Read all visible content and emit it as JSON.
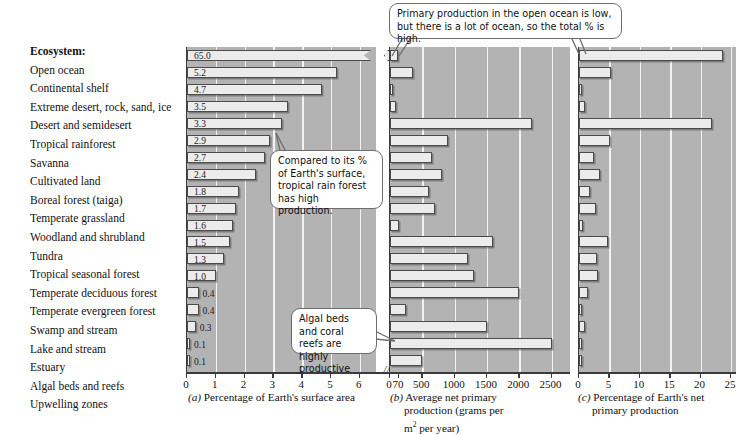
{
  "figure": {
    "ecosystem_header": "Ecosystem:",
    "ecosystems": [
      "Open ocean",
      "Continental shelf",
      "Extreme desert, rock, sand, ice",
      "Desert and semidesert",
      "Tropical rainforest",
      "Savanna",
      "Cultivated land",
      "Boreal forest (taiga)",
      "Temperate grassland",
      "Woodland and shrubland",
      "Tundra",
      "Tropical seasonal forest",
      "Temperate deciduous forest",
      "Temperate evergreen forest",
      "Swamp and stream",
      "Lake and stream",
      "Estuary",
      "Algal beds and reefs",
      "Upwelling zones"
    ],
    "callouts": [
      {
        "id": "open-ocean-callout",
        "text": "Primary production in the open ocean is low, but there is a lot of ocean, so the total % is high."
      },
      {
        "id": "rainforest-callout",
        "text": "Compared to its % of Earth's surface, tropical rain forest has high production."
      },
      {
        "id": "algal-callout",
        "text": "Algal beds and coral reefs are highly productive"
      }
    ]
  },
  "chart_data": [
    {
      "id": "panel-a",
      "type": "bar",
      "orientation": "horizontal",
      "panel_letter": "(a)",
      "title": "Percentage of Earth's surface area",
      "xlabel": "Percentage of Earth's surface area",
      "ylabel": "Ecosystem",
      "xlim": [
        0,
        6.6
      ],
      "axis_break": true,
      "break_note": "axis broken between 6 and 70",
      "xticks": [
        0,
        1,
        2,
        3,
        4,
        5,
        6,
        70
      ],
      "xticklabels": [
        "0",
        "1",
        "2",
        "3",
        "4",
        "5",
        "6",
        "70"
      ],
      "grid": true,
      "legend": false,
      "categories": [
        "Open ocean",
        "Continental shelf",
        "Extreme desert, rock, sand, ice",
        "Desert and semidesert",
        "Tropical rainforest",
        "Savanna",
        "Cultivated land",
        "Boreal forest (taiga)",
        "Temperate grassland",
        "Woodland and shrubland",
        "Tundra",
        "Tropical seasonal forest",
        "Temperate deciduous forest",
        "Temperate evergreen forest",
        "Swamp and stream",
        "Lake and stream",
        "Estuary",
        "Algal beds and reefs",
        "Upwelling zones"
      ],
      "values": [
        65.0,
        5.2,
        4.7,
        3.5,
        3.3,
        2.9,
        2.7,
        2.4,
        1.8,
        1.7,
        1.6,
        1.5,
        1.3,
        1.0,
        0.4,
        0.4,
        0.3,
        0.1,
        0.1
      ],
      "datalabels": [
        "65.0",
        "5.2",
        "4.7",
        "3.5",
        "3.3",
        "2.9",
        "2.7",
        "2.4",
        "1.8",
        "1.7",
        "1.6",
        "1.5",
        "1.3",
        "1.0",
        "0.4",
        "0.4",
        "0.3",
        "0.1",
        "0.1"
      ]
    },
    {
      "id": "panel-b",
      "type": "bar",
      "orientation": "horizontal",
      "panel_letter": "(b)",
      "title": "Average net primary production (grams per m2 per year)",
      "xlabel": "Average net primary production (grams per m² per year)",
      "ylabel": "Ecosystem",
      "xlim": [
        0,
        2800
      ],
      "xticks": [
        0,
        500,
        1000,
        1500,
        2000,
        2500
      ],
      "xticklabels": [
        "0",
        "500",
        "1000",
        "1500",
        "2000",
        "2500"
      ],
      "grid": true,
      "legend": false,
      "categories": [
        "Open ocean",
        "Continental shelf",
        "Extreme desert, rock, sand, ice",
        "Desert and semidesert",
        "Tropical rainforest",
        "Savanna",
        "Cultivated land",
        "Boreal forest (taiga)",
        "Temperate grassland",
        "Woodland and shrubland",
        "Tundra",
        "Tropical seasonal forest",
        "Temperate deciduous forest",
        "Temperate evergreen forest",
        "Swamp and stream",
        "Lake and stream",
        "Estuary",
        "Algal beds and reefs",
        "Upwelling zones"
      ],
      "values": [
        125,
        360,
        3,
        90,
        2200,
        900,
        650,
        800,
        600,
        700,
        140,
        1600,
        1200,
        1300,
        2000,
        250,
        1500,
        2500,
        500
      ]
    },
    {
      "id": "panel-c",
      "type": "bar",
      "orientation": "horizontal",
      "panel_letter": "(c)",
      "title": "Percentage of Earth's net primary production",
      "xlabel": "Percentage of Earth's net primary production",
      "ylabel": "Ecosystem",
      "xlim": [
        0,
        26
      ],
      "xticks": [
        0,
        5,
        10,
        15,
        20,
        25
      ],
      "xticklabels": [
        "0",
        "5",
        "10",
        "15",
        "20",
        "25"
      ],
      "grid": true,
      "legend": false,
      "categories": [
        "Open ocean",
        "Continental shelf",
        "Extreme desert, rock, sand, ice",
        "Desert and semidesert",
        "Tropical rainforest",
        "Savanna",
        "Cultivated land",
        "Boreal forest (taiga)",
        "Temperate grassland",
        "Woodland and shrubland",
        "Tundra",
        "Tropical seasonal forest",
        "Temperate deciduous forest",
        "Temperate evergreen forest",
        "Swamp and stream",
        "Lake and stream",
        "Estuary",
        "Algal beds and reefs",
        "Upwelling zones"
      ],
      "values": [
        23.7,
        5.2,
        0.4,
        1.0,
        21.9,
        5.1,
        2.4,
        3.4,
        1.8,
        2.8,
        0.6,
        4.8,
        2.9,
        3.1,
        1.4,
        0.4,
        1.0,
        0.5,
        0.3
      ]
    }
  ]
}
